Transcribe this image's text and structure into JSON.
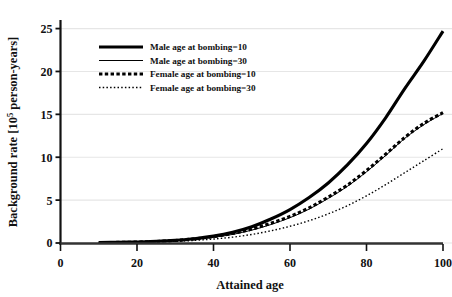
{
  "chart_data": {
    "type": "line",
    "title": "",
    "xlabel": "Attained age",
    "ylabel": "Background rate [10^5 person-years]",
    "ylabel_prefix": "Background rate [10",
    "ylabel_exponent": "5",
    "ylabel_suffix": " person-years]",
    "xlim": [
      0,
      100
    ],
    "ylim": [
      0,
      26
    ],
    "xticks": [
      0,
      20,
      40,
      60,
      80,
      100
    ],
    "yticks": [
      0,
      5,
      10,
      15,
      20,
      25
    ],
    "xtick_labels": [
      "0",
      "20",
      "40",
      "60",
      "80",
      "100"
    ],
    "ytick_labels": [
      "0",
      "5",
      "10",
      "15",
      "20",
      "25"
    ],
    "grid": "horizontal",
    "legend_position": "upper-left-inside",
    "series": [
      {
        "name": "Male age at bombing=10",
        "style": "thick-solid",
        "color": "#000000",
        "x": [
          10,
          15,
          20,
          25,
          30,
          35,
          40,
          45,
          50,
          55,
          60,
          65,
          70,
          75,
          80,
          85,
          90,
          95,
          100
        ],
        "y": [
          0.05,
          0.08,
          0.12,
          0.2,
          0.32,
          0.5,
          0.8,
          1.25,
          1.9,
          2.8,
          3.9,
          5.3,
          7.0,
          9.1,
          11.6,
          14.6,
          18.0,
          21.2,
          24.7
        ]
      },
      {
        "name": "Male age at bombing=30",
        "style": "thin-solid",
        "color": "#000000",
        "x": [
          10,
          15,
          20,
          25,
          30,
          35,
          40,
          45,
          50,
          55,
          60,
          65,
          70,
          75,
          80,
          85,
          90,
          95,
          100
        ],
        "y": [
          0.04,
          0.06,
          0.1,
          0.16,
          0.26,
          0.42,
          0.66,
          1.0,
          1.5,
          2.15,
          2.95,
          3.95,
          5.2,
          6.6,
          8.3,
          10.2,
          12.2,
          13.8,
          15.1
        ]
      },
      {
        "name": "Female age at bombing=10",
        "style": "thick-dashed",
        "color": "#000000",
        "x": [
          10,
          15,
          20,
          25,
          30,
          35,
          40,
          45,
          50,
          55,
          60,
          65,
          70,
          75,
          80,
          85,
          90,
          95,
          100
        ],
        "y": [
          0.05,
          0.07,
          0.11,
          0.18,
          0.3,
          0.48,
          0.75,
          1.12,
          1.62,
          2.3,
          3.1,
          4.1,
          5.35,
          6.75,
          8.45,
          10.35,
          12.3,
          13.95,
          15.2
        ]
      },
      {
        "name": "Female age at bombing=30",
        "style": "thin-dotted",
        "color": "#000000",
        "x": [
          10,
          15,
          20,
          25,
          30,
          35,
          40,
          45,
          50,
          55,
          60,
          65,
          70,
          75,
          80,
          85,
          90,
          95,
          100
        ],
        "y": [
          0.03,
          0.05,
          0.08,
          0.12,
          0.2,
          0.3,
          0.46,
          0.68,
          1.0,
          1.42,
          1.95,
          2.6,
          3.4,
          4.35,
          5.5,
          6.8,
          8.2,
          9.6,
          11.0
        ]
      }
    ],
    "legend_entries": [
      "Male age at bombing=10",
      "Male age at bombing=30",
      "Female age at bombing=10",
      "Female age at bombing=30"
    ]
  }
}
